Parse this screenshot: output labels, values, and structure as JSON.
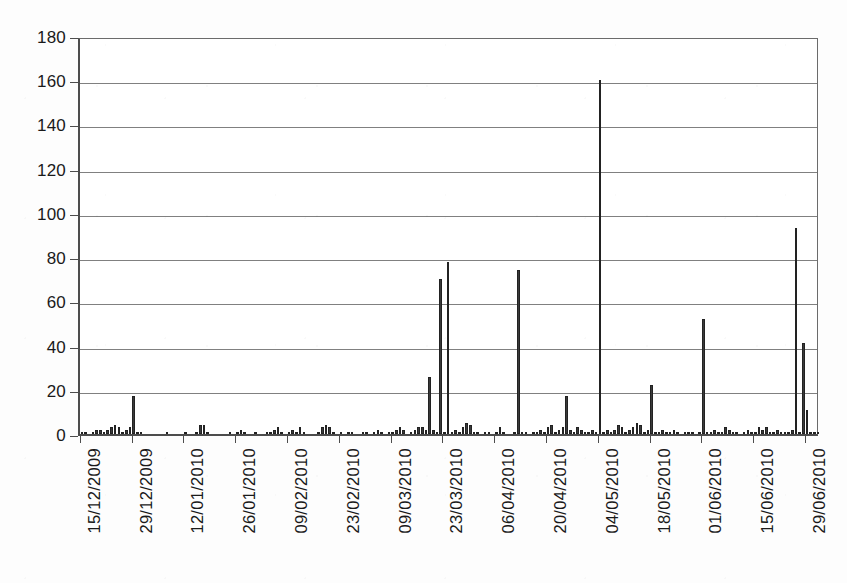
{
  "chart_data": {
    "type": "bar",
    "title": "",
    "subtitle": "",
    "xlabel": "",
    "ylabel": "",
    "ylim": [
      0,
      180
    ],
    "ytick_step": 20,
    "yticks": [
      0,
      20,
      40,
      60,
      80,
      100,
      120,
      140,
      160,
      180
    ],
    "ytick_labels": [
      "0",
      "20",
      "40",
      "60",
      "80",
      "100",
      "120",
      "140",
      "160",
      "180"
    ],
    "grid": true,
    "grid_axis": "y",
    "legend": false,
    "legend_position": "none",
    "bar_color": "#3a3a3a",
    "xtick_labels": [
      "15/12/2009",
      "29/12/2009",
      "12/01/2010",
      "26/01/2010",
      "09/02/2010",
      "23/02/2010",
      "09/03/2010",
      "23/03/2010",
      "06/04/2010",
      "20/04/2010",
      "04/05/2010",
      "18/05/2010",
      "01/06/2010",
      "15/06/2010",
      "29/06/2010"
    ],
    "xtick_interval_days": 14,
    "x_start": "15/12/2009",
    "x_end": "02/07/2010",
    "categories": [
      "15/12/2009",
      "16/12/2009",
      "17/12/2009",
      "18/12/2009",
      "19/12/2009",
      "20/12/2009",
      "21/12/2009",
      "22/12/2009",
      "23/12/2009",
      "24/12/2009",
      "25/12/2009",
      "26/12/2009",
      "27/12/2009",
      "28/12/2009",
      "29/12/2009",
      "30/12/2009",
      "31/12/2009",
      "01/01/2010",
      "02/01/2010",
      "03/01/2010",
      "04/01/2010",
      "05/01/2010",
      "06/01/2010",
      "07/01/2010",
      "08/01/2010",
      "09/01/2010",
      "10/01/2010",
      "11/01/2010",
      "12/01/2010",
      "13/01/2010",
      "14/01/2010",
      "15/01/2010",
      "16/01/2010",
      "17/01/2010",
      "18/01/2010",
      "19/01/2010",
      "20/01/2010",
      "21/01/2010",
      "22/01/2010",
      "23/01/2010",
      "24/01/2010",
      "25/01/2010",
      "26/01/2010",
      "27/01/2010",
      "28/01/2010",
      "29/01/2010",
      "30/01/2010",
      "31/01/2010",
      "01/02/2010",
      "02/02/2010",
      "03/02/2010",
      "04/02/2010",
      "05/02/2010",
      "06/02/2010",
      "07/02/2010",
      "08/02/2010",
      "09/02/2010",
      "10/02/2010",
      "11/02/2010",
      "12/02/2010",
      "13/02/2010",
      "14/02/2010",
      "15/02/2010",
      "16/02/2010",
      "17/02/2010",
      "18/02/2010",
      "19/02/2010",
      "20/02/2010",
      "21/02/2010",
      "22/02/2010",
      "23/02/2010",
      "24/02/2010",
      "25/02/2010",
      "26/02/2010",
      "27/02/2010",
      "28/02/2010",
      "01/03/2010",
      "02/03/2010",
      "03/03/2010",
      "04/03/2010",
      "05/03/2010",
      "06/03/2010",
      "07/03/2010",
      "08/03/2010",
      "09/03/2010",
      "10/03/2010",
      "11/03/2010",
      "12/03/2010",
      "13/03/2010",
      "14/03/2010",
      "15/03/2010",
      "16/03/2010",
      "17/03/2010",
      "18/03/2010",
      "19/03/2010",
      "20/03/2010",
      "21/03/2010",
      "22/03/2010",
      "23/03/2010",
      "24/03/2010",
      "25/03/2010",
      "26/03/2010",
      "27/03/2010",
      "28/03/2010",
      "29/03/2010",
      "30/03/2010",
      "31/03/2010",
      "01/04/2010",
      "02/04/2010",
      "03/04/2010",
      "04/04/2010",
      "05/04/2010",
      "06/04/2010",
      "07/04/2010",
      "08/04/2010",
      "09/04/2010",
      "10/04/2010",
      "11/04/2010",
      "12/04/2010",
      "13/04/2010",
      "14/04/2010",
      "15/04/2010",
      "16/04/2010",
      "17/04/2010",
      "18/04/2010",
      "19/04/2010",
      "20/04/2010",
      "21/04/2010",
      "22/04/2010",
      "23/04/2010",
      "24/04/2010",
      "25/04/2010",
      "26/04/2010",
      "27/04/2010",
      "28/04/2010",
      "29/04/2010",
      "30/04/2010",
      "01/05/2010",
      "02/05/2010",
      "03/05/2010",
      "04/05/2010",
      "05/05/2010",
      "06/05/2010",
      "07/05/2010",
      "08/05/2010",
      "09/05/2010",
      "10/05/2010",
      "11/05/2010",
      "12/05/2010",
      "13/05/2010",
      "14/05/2010",
      "15/05/2010",
      "16/05/2010",
      "17/05/2010",
      "18/05/2010",
      "19/05/2010",
      "20/05/2010",
      "21/05/2010",
      "22/05/2010",
      "23/05/2010",
      "24/05/2010",
      "25/05/2010",
      "26/05/2010",
      "27/05/2010",
      "28/05/2010",
      "29/05/2010",
      "30/05/2010",
      "31/05/2010",
      "01/06/2010",
      "02/06/2010",
      "03/06/2010",
      "04/06/2010",
      "05/06/2010",
      "06/06/2010",
      "07/06/2010",
      "08/06/2010",
      "09/06/2010",
      "10/06/2010",
      "11/06/2010",
      "12/06/2010",
      "13/06/2010",
      "14/06/2010",
      "15/06/2010",
      "16/06/2010",
      "17/06/2010",
      "18/06/2010",
      "19/06/2010",
      "20/06/2010",
      "21/06/2010",
      "22/06/2010",
      "23/06/2010",
      "24/06/2010",
      "25/06/2010",
      "26/06/2010",
      "27/06/2010",
      "28/06/2010",
      "29/06/2010",
      "30/06/2010",
      "01/07/2010",
      "02/07/2010"
    ],
    "values": [
      1,
      1,
      0,
      1,
      2,
      2,
      1,
      2,
      3,
      4,
      3,
      1,
      2,
      3,
      17,
      1,
      1,
      0,
      0,
      0,
      0,
      0,
      0,
      1,
      0,
      0,
      0,
      0,
      1,
      0,
      0,
      1,
      4,
      4,
      1,
      0,
      0,
      0,
      0,
      0,
      1,
      0,
      1,
      2,
      1,
      0,
      0,
      1,
      0,
      0,
      1,
      1,
      2,
      3,
      1,
      0,
      1,
      2,
      1,
      3,
      1,
      0,
      0,
      0,
      1,
      3,
      4,
      3,
      1,
      0,
      1,
      0,
      1,
      1,
      0,
      0,
      1,
      1,
      0,
      1,
      2,
      1,
      0,
      1,
      1,
      2,
      3,
      2,
      0,
      1,
      2,
      3,
      3,
      2,
      26,
      2,
      1,
      70,
      1,
      78,
      1,
      2,
      1,
      3,
      5,
      4,
      1,
      1,
      0,
      1,
      1,
      0,
      1,
      3,
      1,
      0,
      0,
      1,
      74,
      1,
      1,
      0,
      1,
      1,
      2,
      1,
      3,
      4,
      1,
      2,
      3,
      17,
      2,
      1,
      3,
      2,
      1,
      1,
      2,
      1,
      160,
      1,
      2,
      1,
      2,
      4,
      3,
      1,
      2,
      3,
      5,
      4,
      1,
      2,
      22,
      1,
      1,
      2,
      1,
      1,
      2,
      1,
      0,
      1,
      1,
      1,
      0,
      1,
      52,
      1,
      1,
      2,
      1,
      1,
      3,
      2,
      1,
      1,
      0,
      1,
      2,
      1,
      1,
      3,
      2,
      3,
      1,
      1,
      2,
      1,
      1,
      1,
      2,
      93,
      1,
      41,
      11,
      1,
      1,
      1
    ],
    "annotations": [
      {
        "date": "29/12/2009",
        "value": 17
      },
      {
        "date": "19/03/2010",
        "value": 26
      },
      {
        "date": "22/03/2010",
        "value": 70
      },
      {
        "date": "24/03/2010",
        "value": 78
      },
      {
        "date": "11/04/2010",
        "value": 74
      },
      {
        "date": "29/04/2010",
        "value": 17
      },
      {
        "date": "04/05/2010",
        "value": 160
      },
      {
        "date": "16/05/2010",
        "value": 22
      },
      {
        "date": "01/06/2010",
        "value": 52
      },
      {
        "date": "26/06/2010",
        "value": 93
      },
      {
        "date": "28/06/2010",
        "value": 41
      },
      {
        "date": "29/06/2010",
        "value": 11
      }
    ],
    "max_value": 160,
    "min_value": 0
  }
}
